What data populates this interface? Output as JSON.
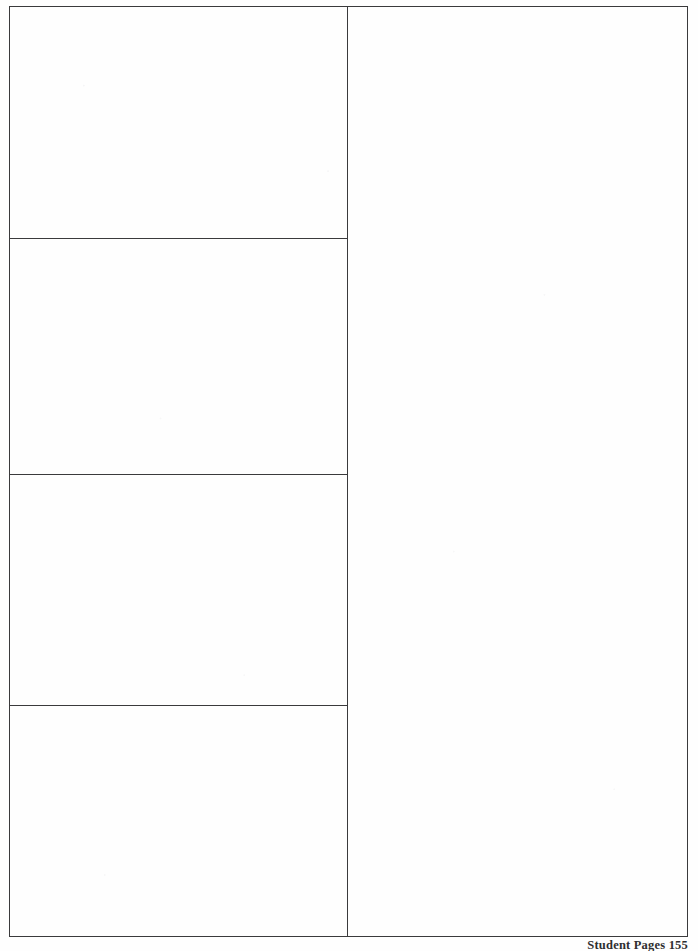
{
  "document": {
    "type": "blank-worksheet-page",
    "background_color": "#fefefe",
    "rule_color": "#3a3a3c"
  },
  "worksheet": {
    "left_column": {
      "label": "answer-boxes-column",
      "cells": [
        {
          "index": 1,
          "content": ""
        },
        {
          "index": 2,
          "content": ""
        },
        {
          "index": 3,
          "content": ""
        },
        {
          "index": 4,
          "content": ""
        }
      ]
    },
    "right_column": {
      "label": "open-work-area",
      "content": ""
    }
  },
  "footer": {
    "text": "Student Pages 155",
    "series_label": "Student Pages",
    "page_number": "155"
  }
}
